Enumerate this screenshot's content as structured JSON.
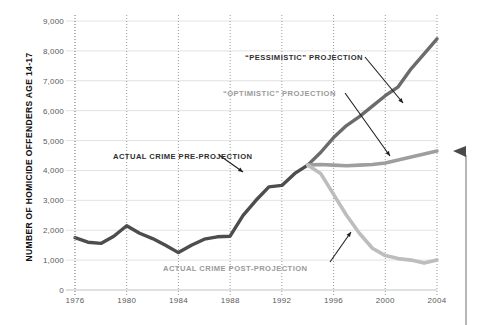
{
  "chart_data": {
    "type": "line",
    "title": "",
    "xlabel": "",
    "ylabel": "NUMBER OF HOMICIDE OFFENDERS AGE 14-17",
    "xlim": [
      1976,
      2004
    ],
    "ylim": [
      0,
      9000
    ],
    "xticks": [
      "1976",
      "1980",
      "1984",
      "1988",
      "1992",
      "1996",
      "2000",
      "2004"
    ],
    "yticks": [
      "0",
      "1,000",
      "2,000",
      "3,000",
      "4,000",
      "5,000",
      "6,000",
      "7,000",
      "8,000",
      "9,000"
    ],
    "ytick_values": [
      0,
      1000,
      2000,
      3000,
      4000,
      5000,
      6000,
      7000,
      8000,
      9000
    ],
    "grid": "both-dotted-vertical-solid-horizontal",
    "legend": "none-inline-annotations",
    "series": [
      {
        "name": "ACTUAL CRIME PRE-PROJECTION",
        "color": "#4d4d4d",
        "x": [
          1976,
          1977,
          1978,
          1979,
          1980,
          1981,
          1982,
          1983,
          1984,
          1985,
          1986,
          1987,
          1988,
          1989,
          1990,
          1991,
          1992,
          1993,
          1994
        ],
        "values": [
          1750,
          1600,
          1560,
          1800,
          2150,
          1900,
          1720,
          1500,
          1250,
          1500,
          1700,
          1780,
          1800,
          2500,
          3000,
          3450,
          3500,
          3900,
          4180
        ]
      },
      {
        "name": "“PESSIMISTIC” PROJECTION",
        "color": "#6b6b6b",
        "x": [
          1994,
          1995,
          1996,
          1997,
          1998,
          1999,
          2000,
          2001,
          2002,
          2003,
          2004
        ],
        "values": [
          4180,
          4600,
          5100,
          5500,
          5800,
          6150,
          6500,
          6800,
          7400,
          7900,
          8400
        ]
      },
      {
        "name": "“OPTIMISTIC” PROJECTION",
        "color": "#9e9e9e",
        "x": [
          1994,
          1995,
          1996,
          1997,
          1998,
          1999,
          2000,
          2001,
          2002,
          2003,
          2004
        ],
        "values": [
          4180,
          4200,
          4180,
          4160,
          4180,
          4200,
          4250,
          4350,
          4450,
          4550,
          4650
        ]
      },
      {
        "name": "ACTUAL CRIME POST-PROJECTION",
        "color": "#bdbdbd",
        "x": [
          1994,
          1995,
          1996,
          1997,
          1998,
          1999,
          2000,
          2001,
          2002,
          2003,
          2004
        ],
        "values": [
          4180,
          3900,
          3200,
          2500,
          1900,
          1400,
          1150,
          1050,
          1000,
          900,
          1000
        ]
      }
    ],
    "annotations": [
      {
        "label": "“PESSIMISTIC” PROJECTION",
        "color": "#2f2f2f"
      },
      {
        "label": "“OPTIMISTIC” PROJECTION",
        "color": "#9a9a9a"
      },
      {
        "label": "ACTUAL CRIME PRE-PROJECTION",
        "color": "#2f2f2f"
      },
      {
        "label": "ACTUAL CRIME POST-PROJECTION",
        "color": "#9a9a9a"
      }
    ],
    "marker": {
      "name": "right-edge-arrow-bracket",
      "color": "#6b6b6b"
    }
  }
}
